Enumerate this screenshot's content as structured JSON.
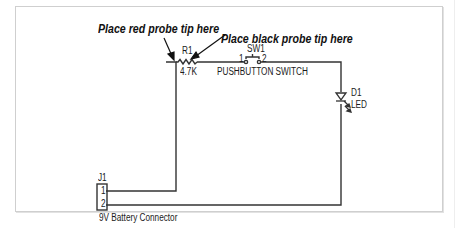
{
  "diagram": {
    "type": "schematic",
    "callouts": {
      "red_probe": "Place red probe tip here",
      "black_probe": "Place black probe tip here"
    },
    "components": {
      "R1": {
        "ref": "R1",
        "value": "4.7K",
        "type": "resistor"
      },
      "SW1": {
        "ref": "SW1",
        "type": "pushbutton",
        "pin1": "1",
        "pin2": "2",
        "label": "PUSHBUTTON SWITCH"
      },
      "D1": {
        "ref": "D1",
        "value": "LED",
        "type": "led"
      },
      "J1": {
        "ref": "J1",
        "pin1": "1",
        "pin2": "2",
        "label": "9V Battery Connector"
      }
    },
    "colors": {
      "wire": "#333333",
      "frame": "#cfcfcf",
      "text": "#1a1a1a"
    }
  }
}
